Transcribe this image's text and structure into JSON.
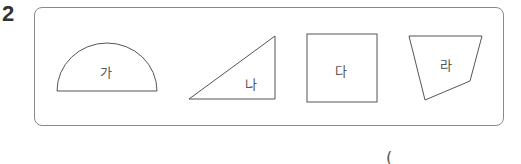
{
  "question": {
    "number": "2"
  },
  "shapes": [
    {
      "label": "가",
      "type": "semicircle"
    },
    {
      "label": "나",
      "type": "right-triangle"
    },
    {
      "label": "다",
      "type": "square"
    },
    {
      "label": "라",
      "type": "quadrilateral"
    }
  ],
  "answer": {
    "open_paren": "("
  },
  "colors": {
    "stroke": "#555555",
    "box_border": "#8a8a8a",
    "text": "#333333"
  }
}
